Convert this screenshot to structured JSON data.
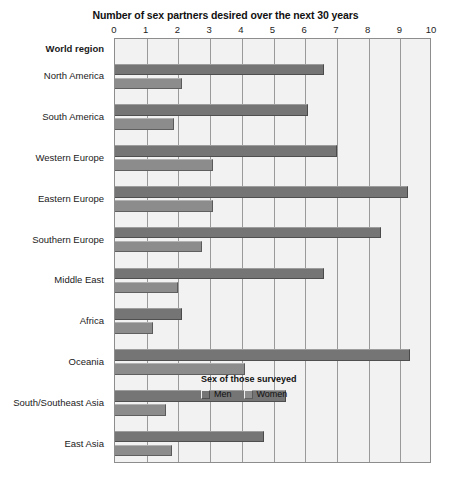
{
  "chart_data": {
    "type": "bar",
    "orientation": "horizontal",
    "title": "Number of sex partners desired over the next 30 years",
    "xlabel": "",
    "ylabel": "World region",
    "xlim": [
      0,
      10
    ],
    "xticks": [
      0,
      1,
      2,
      3,
      4,
      5,
      6,
      7,
      8,
      9,
      10
    ],
    "xtick_labels": [
      "0",
      "1",
      "2",
      "3",
      "4",
      "5",
      "6",
      "7",
      "8",
      "9",
      "10"
    ],
    "grid": true,
    "legend_title": "Sex of those surveyed",
    "legend_position": "inside-bottom-right",
    "categories": [
      "North America",
      "South America",
      "Western Europe",
      "Eastern Europe",
      "Southern Europe",
      "Middle East",
      "Africa",
      "Oceania",
      "South/Southeast Asia",
      "East Asia"
    ],
    "series": [
      {
        "name": "Men",
        "color": "#757575",
        "values": [
          6.6,
          6.1,
          7.0,
          9.25,
          8.4,
          6.6,
          2.1,
          9.3,
          5.4,
          4.7
        ]
      },
      {
        "name": "Women",
        "color": "#8c8c8c",
        "values": [
          2.1,
          1.85,
          3.1,
          3.1,
          2.75,
          2.0,
          1.2,
          4.1,
          1.6,
          1.8
        ]
      }
    ]
  },
  "labels": {
    "row_header": "World region"
  },
  "colors": {
    "plot_background": "#f2f2f2",
    "plot_border": "#8d8d8d",
    "gridline": "#9a9a9a",
    "men": "#757575",
    "women": "#8c8c8c"
  }
}
